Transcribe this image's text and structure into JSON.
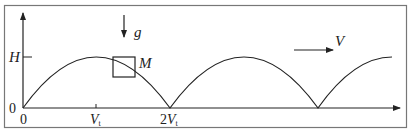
{
  "figure": {
    "axes": {
      "y_tick_label": "H",
      "y_origin_label": "0",
      "x_origin_label": "0",
      "x_tick_1": {
        "main": "V",
        "sub": "t"
      },
      "x_tick_2": {
        "coef": "2",
        "main": "V",
        "sub": "t"
      }
    },
    "gravity": {
      "label": "g"
    },
    "block": {
      "label": "M"
    },
    "velocity": {
      "label": "V"
    },
    "colors": {
      "stroke": "#222222",
      "frame": "#666666",
      "background": "#ffffff"
    }
  }
}
